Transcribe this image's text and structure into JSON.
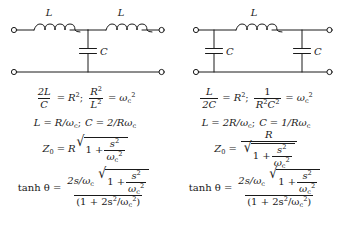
{
  "figure": {
    "type": "two-port-filter-comparison",
    "circuits": [
      {
        "id": "tee-section",
        "name": "T-section low-pass filter",
        "topology": "series L, shunt C, series L",
        "components": [
          {
            "ref": "L1",
            "kind": "inductor",
            "label": "L"
          },
          {
            "ref": "L2",
            "kind": "inductor",
            "label": "L"
          },
          {
            "ref": "C1",
            "kind": "capacitor",
            "label": "C"
          }
        ],
        "terminals": 4
      },
      {
        "id": "pi-section",
        "name": "Pi-section low-pass filter",
        "topology": "shunt C, series L, shunt C",
        "components": [
          {
            "ref": "L1",
            "kind": "inductor",
            "label": "L"
          },
          {
            "ref": "C1",
            "kind": "capacitor",
            "label": "C"
          },
          {
            "ref": "C2",
            "kind": "capacitor",
            "label": "C"
          }
        ],
        "terminals": 4
      }
    ],
    "columns": [
      {
        "id": "tee-equations",
        "rows": [
          {
            "id": "design-relation",
            "parts": {
              "lhs_num": "2L",
              "lhs_den": "C",
              "rhs1": "R",
              "rhs1_sup": "2",
              "sep": ";",
              "lhs2_num": "R",
              "lhs2_num_sup": "2",
              "lhs2_den": "L",
              "lhs2_den_sup": "2",
              "rhs2": "ω",
              "rhs2_sub": "c",
              "rhs2_sup": "2"
            }
          },
          {
            "id": "element-values",
            "text_l": "L",
            "text_l_rhs": "R/ω",
            "text_l_rhs_sub": "c",
            "semi": ";",
            "text_c": "C",
            "text_c_rhs": "2/Rω",
            "text_c_rhs_sub": "c"
          },
          {
            "id": "image-impedance",
            "lhs": "Z",
            "lhs_sub": "0",
            "coef": "R",
            "radicand_a": "1 +",
            "radicand_num": "s",
            "radicand_num_sup": "2",
            "radicand_den": "ω",
            "radicand_den_sub": "c",
            "radicand_den_sup": "2",
            "form": "product"
          },
          {
            "id": "propagation-function",
            "lhs": "tanh θ",
            "num_coef": "2s/ω",
            "num_coef_sub": "c",
            "num_rad_a": "1 +",
            "num_rad_num": "s",
            "num_rad_num_sup": "2",
            "num_rad_den": "ω",
            "num_rad_den_sub": "c",
            "num_rad_den_sup": "2",
            "den": "(1 + 2s",
            "den_sup": "2",
            "den_mid": "/ω",
            "den_sub": "c",
            "den_sup2": "2",
            "den_close": ")"
          }
        ]
      },
      {
        "id": "pi-equations",
        "rows": [
          {
            "id": "design-relation",
            "parts": {
              "lhs_num": "L",
              "lhs_den": "2C",
              "rhs1": "R",
              "rhs1_sup": "2",
              "sep": ";",
              "lhs2_num": "1",
              "lhs2_den": "R",
              "lhs2_den_sup": "2",
              "lhs2_den2": "C",
              "lhs2_den2_sup": "2",
              "rhs2": "ω",
              "rhs2_sub": "c",
              "rhs2_sup": "2"
            }
          },
          {
            "id": "element-values",
            "text_l": "L",
            "text_l_rhs": "2R/ω",
            "text_l_rhs_sub": "c",
            "semi": ";",
            "text_c": "C",
            "text_c_rhs": "1/Rω",
            "text_c_rhs_sub": "c"
          },
          {
            "id": "image-impedance",
            "lhs": "Z",
            "lhs_sub": "0",
            "coef": "R",
            "radicand_a": "1 +",
            "radicand_num": "s",
            "radicand_num_sup": "2",
            "radicand_den": "ω",
            "radicand_den_sub": "c",
            "radicand_den_sup": "2",
            "form": "quotient"
          },
          {
            "id": "propagation-function",
            "lhs": "tanh θ",
            "num_coef": "2s/ω",
            "num_coef_sub": "c",
            "num_rad_a": "1 +",
            "num_rad_num": "s",
            "num_rad_num_sup": "2",
            "num_rad_den": "ω",
            "num_rad_den_sub": "c",
            "num_rad_den_sup": "2",
            "den": "(1 + 2s",
            "den_sup": "2",
            "den_mid": "/ω",
            "den_sub": "c",
            "den_sup2": "2",
            "den_close": ")"
          }
        ]
      }
    ],
    "symbols": {
      "equals": "=",
      "plus": "+",
      "radical": "√"
    },
    "colors": {
      "ink": "#1a1a1a",
      "background": "#ffffff"
    }
  }
}
